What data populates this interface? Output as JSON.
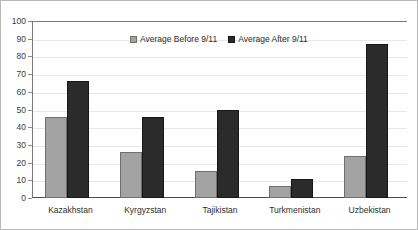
{
  "chart_data": {
    "type": "bar",
    "title": "",
    "subtitle": "",
    "xlabel": "",
    "ylabel": "",
    "ylim": [
      0,
      100
    ],
    "yticks": [
      0,
      10,
      20,
      30,
      40,
      50,
      60,
      70,
      80,
      90,
      100
    ],
    "grid": true,
    "legend_position": "top-center",
    "categories": [
      "Kazakhstan",
      "Kyrgyzstan",
      "Tajikistan",
      "Turkmenistan",
      "Uzbekistan"
    ],
    "series": [
      {
        "name": "Average Before 9/11",
        "color": "#a3a3a3",
        "values": [
          46,
          26,
          15,
          7,
          24
        ]
      },
      {
        "name": "Average After 9/11",
        "color": "#2b2b2b",
        "values": [
          66,
          46,
          50,
          11,
          87
        ]
      }
    ]
  }
}
